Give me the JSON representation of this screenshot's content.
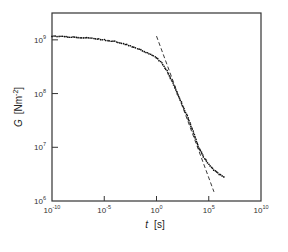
{
  "chart_data": {
    "type": "scatter",
    "title": "",
    "xlabel": "t  [s]",
    "ylabel": "G  [N·m⁻²]",
    "xscale": "log",
    "yscale": "log",
    "xlim": [
      1e-10,
      10000000000.0
    ],
    "ylim": [
      1000000.0,
      3200000000.0
    ],
    "grid": false,
    "legend": null,
    "x_ticks": [
      "10^-10",
      "10^-5",
      "10^0",
      "10^5",
      "10^10"
    ],
    "y_ticks": [
      "10^6",
      "10^7",
      "10^8",
      "10^9"
    ],
    "series": [
      {
        "name": "G(t) data",
        "style": "dotted markers",
        "x_log10": [
          -10,
          -8,
          -6,
          -5,
          -4,
          -3,
          -2,
          -1,
          0,
          0.5,
          1,
          1.5,
          2,
          2.5,
          3,
          3.5,
          4,
          4.5,
          5,
          5.5,
          6,
          6.6
        ],
        "y_log10": [
          9.07,
          9.05,
          9.03,
          9.0,
          8.97,
          8.92,
          8.85,
          8.77,
          8.67,
          8.57,
          8.42,
          8.22,
          8.0,
          7.78,
          7.55,
          7.3,
          7.02,
          6.82,
          6.68,
          6.58,
          6.5,
          6.44
        ]
      },
      {
        "name": "power-law fit",
        "style": "dashed line",
        "x_log10": [
          0,
          5.5
        ],
        "y_log10": [
          9.07,
          6.17
        ]
      }
    ]
  },
  "axes": {
    "x_label_main": "t",
    "x_label_unit": "[s]",
    "y_label_main": "G",
    "y_label_unit": "[Nm",
    "y_label_exp": "-2",
    "y_label_close": "]",
    "x_tick_base": "10",
    "x_tick_exps": [
      "-10",
      "-5",
      "0",
      "5",
      "10"
    ],
    "y_tick_base": "10",
    "y_tick_exps": [
      "6",
      "7",
      "8",
      "9"
    ]
  }
}
